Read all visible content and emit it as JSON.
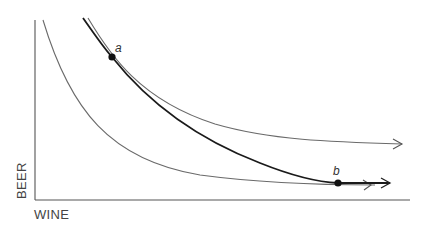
{
  "diagram": {
    "type": "indifference-curves",
    "axes": {
      "x_label": "WINE",
      "y_label": "BEER"
    },
    "points": [
      {
        "id": "a",
        "label": "a"
      },
      {
        "id": "b",
        "label": "b"
      }
    ],
    "curves": [
      {
        "id": "lower-thin",
        "style": "thin",
        "arrow": true
      },
      {
        "id": "upper-thin",
        "style": "thin",
        "arrow": true,
        "touches": "a"
      },
      {
        "id": "thick",
        "style": "thick",
        "arrow": true,
        "passes_through": [
          "a",
          "b"
        ]
      }
    ],
    "colors": {
      "background": "#ffffff",
      "axis": "#555555",
      "thin_curve": "#6a6a6a",
      "thick_curve": "#1a1a1a",
      "point": "#111111"
    }
  }
}
